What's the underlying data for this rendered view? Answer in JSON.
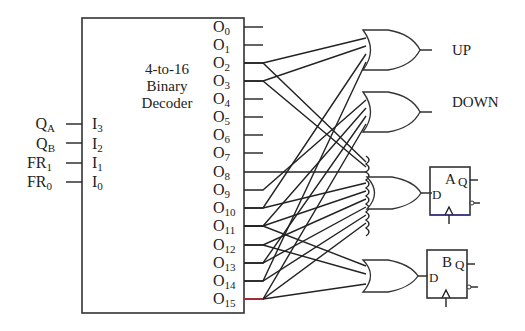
{
  "decoder": {
    "title_line1": "4-to-16",
    "title_line2": "Binary",
    "title_line3": "Decoder",
    "inputs": [
      {
        "signal": "Q",
        "signal_sub": "A",
        "pin": "I",
        "pin_sub": "3"
      },
      {
        "signal": "Q",
        "signal_sub": "B",
        "pin": "I",
        "pin_sub": "2"
      },
      {
        "signal": "FR",
        "signal_sub": "1",
        "pin": "I",
        "pin_sub": "1"
      },
      {
        "signal": "FR",
        "signal_sub": "0",
        "pin": "I",
        "pin_sub": "0"
      }
    ],
    "outputs": [
      {
        "name": "O",
        "sub": "0"
      },
      {
        "name": "O",
        "sub": "1"
      },
      {
        "name": "O",
        "sub": "2"
      },
      {
        "name": "O",
        "sub": "3"
      },
      {
        "name": "O",
        "sub": "4"
      },
      {
        "name": "O",
        "sub": "5"
      },
      {
        "name": "O",
        "sub": "6"
      },
      {
        "name": "O",
        "sub": "7"
      },
      {
        "name": "O",
        "sub": "8"
      },
      {
        "name": "O",
        "sub": "9"
      },
      {
        "name": "O",
        "sub": "10"
      },
      {
        "name": "O",
        "sub": "11"
      },
      {
        "name": "O",
        "sub": "12"
      },
      {
        "name": "O",
        "sub": "13"
      },
      {
        "name": "O",
        "sub": "14"
      },
      {
        "name": "O",
        "sub": "15"
      }
    ]
  },
  "gates": {
    "up_label": "UP",
    "down_label": "DOWN"
  },
  "flipflops": [
    {
      "name": "A",
      "d_label": "D",
      "q_label": "Q"
    },
    {
      "name": "B",
      "d_label": "D",
      "q_label": "Q"
    }
  ]
}
